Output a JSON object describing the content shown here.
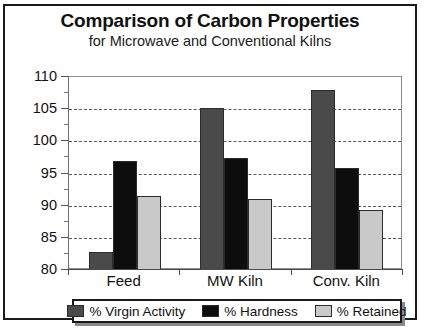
{
  "chart_data": {
    "type": "bar",
    "title": "Comparison of Carbon Properties",
    "subtitle": "for Microwave and Conventional Kilns",
    "xlabel": "",
    "ylabel": "",
    "categories": [
      "Feed",
      "MW Kiln",
      "Conv. Kiln"
    ],
    "series": [
      {
        "name": "% Virgin Activity",
        "color": "#4a4a4a",
        "values": [
          82.8,
          105.2,
          108.0
        ]
      },
      {
        "name": "% Hardness",
        "color": "#0d0d0d",
        "values": [
          97.0,
          97.4,
          95.8
        ]
      },
      {
        "name": "% Retained",
        "color": "#c9c9c9",
        "values": [
          91.5,
          91.1,
          89.3
        ]
      }
    ],
    "ylim": [
      80,
      110
    ],
    "y_ticks": [
      80,
      85,
      90,
      95,
      100,
      105,
      110
    ],
    "y_minor_ticks": [
      82.5,
      87.5,
      92.5,
      97.5,
      102.5,
      107.5
    ],
    "grid": true,
    "grid_style": "dashed-horizontal",
    "legend_position": "bottom",
    "frame": true
  }
}
